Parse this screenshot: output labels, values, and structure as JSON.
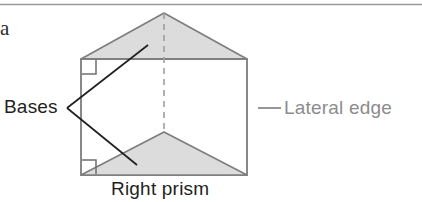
{
  "page": {
    "width": 422,
    "height": 202,
    "background": "#ffffff",
    "top_rule": {
      "name": "horizontal-rule",
      "y": 4,
      "x1": 0,
      "x2": 422,
      "color": "#9a9a9a"
    }
  },
  "item_letter": {
    "text": "a"
  },
  "labels": {
    "bases": "Bases",
    "lateral_edge": "Lateral edge",
    "right_prism": "Right prism"
  },
  "colors": {
    "face_fill": "#dcdcdc",
    "outline": "#7d7d7d",
    "dashed_edge": "#9e9e9e",
    "leader_dark": "#231f20",
    "leader_gray": "#8c8c8c",
    "text_dark": "#231f20",
    "text_gray": "#8c8c8c",
    "rule": "#9a9a9a"
  },
  "figure": {
    "name": "right-triangular-prism",
    "geometry": {
      "rect": {
        "left": 81,
        "top": 59,
        "right": 247,
        "bottom": 175
      },
      "top_triangle_apex": {
        "x": 164,
        "y": 13
      },
      "front_triangle_apex": {
        "x": 164,
        "y": 132
      },
      "dashed_edge": {
        "x": 164,
        "y1": 13,
        "y2": 132
      },
      "right_angle_markers": [
        {
          "x": 82,
          "y": 60,
          "size": 14
        },
        {
          "x": 82,
          "y": 160,
          "size": 14
        }
      ]
    },
    "leaders": {
      "bases_fork_point": {
        "x": 67,
        "y": 108
      },
      "bases_to_top_base_end": {
        "x": 148,
        "y": 45
      },
      "bases_to_front_base_end": {
        "x": 137,
        "y": 165
      },
      "lateral_edge_dash": {
        "x1": 258,
        "y1": 108,
        "x2": 281,
        "y2": 108
      }
    }
  }
}
